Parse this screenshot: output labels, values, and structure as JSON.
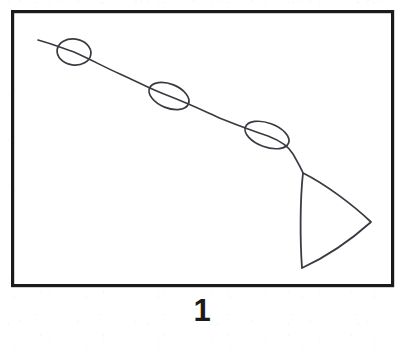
{
  "figure": {
    "caption": "1",
    "title": "",
    "kind": "hand-drawn-line-diagram",
    "colors": {
      "page_background": "#ffffff",
      "frame_stroke": "#1b1b1b",
      "drawing_stroke": "#3a3a42",
      "caption_text": "#1b1b1b"
    },
    "frame": {
      "name": "panel-border",
      "x": 11,
      "y": 10,
      "width": 383,
      "height": 277,
      "stroke_width": 3.2
    },
    "polyline": {
      "name": "descending-line",
      "points": "38,40 74,52 120,73 169,96 215,116 267,135 289,148 303,173",
      "stroke_width": 1.5
    },
    "ellipses": [
      {
        "name": "bead-1",
        "cx": 74,
        "cy": 52,
        "rx": 17,
        "ry": 13,
        "rotation": 8,
        "stroke_width": 1.6
      },
      {
        "name": "bead-2",
        "cx": 169,
        "cy": 96,
        "rx": 21,
        "ry": 12,
        "rotation": 22,
        "stroke_width": 1.6
      },
      {
        "name": "bead-3",
        "cx": 267,
        "cy": 135,
        "rx": 23,
        "ry": 12,
        "rotation": 20,
        "stroke_width": 1.6
      }
    ],
    "triangle": {
      "name": "triangle-head",
      "apex": [
        303,
        173
      ],
      "right_vertex": [
        371,
        222
      ],
      "bottom_vertex": [
        302,
        268
      ],
      "stroke_width": 1.8
    }
  }
}
